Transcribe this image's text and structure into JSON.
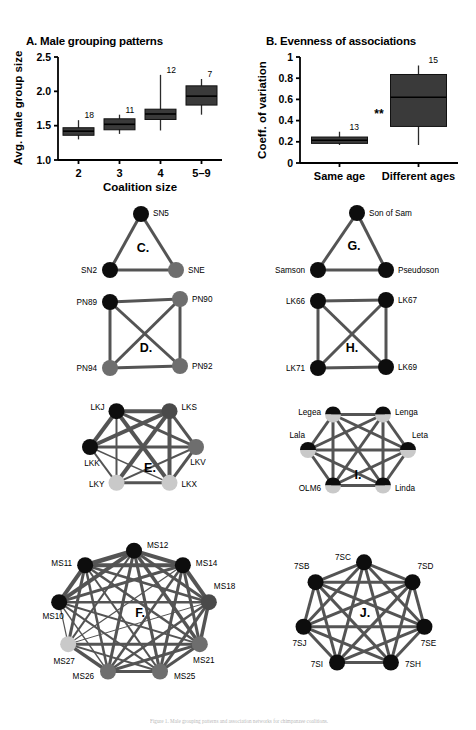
{
  "figure": {
    "caption_fragment": "Figure 1. Male grouping patterns and association networks for chimpanzee coalitions."
  },
  "panels": {
    "A": {
      "letter": "A.",
      "title": "Male grouping patterns",
      "ylabel": "Avg. male group size",
      "xlabel": "Coalition size"
    },
    "B": {
      "letter": "B.",
      "title": "Evenness of associations",
      "ylabel": "Coeff. of variation",
      "xlabel": "",
      "significance": "**"
    },
    "C": {
      "letter": "C."
    },
    "D": {
      "letter": "D."
    },
    "E": {
      "letter": "E."
    },
    "F": {
      "letter": "F."
    },
    "G": {
      "letter": "G."
    },
    "H": {
      "letter": "H."
    },
    "I": {
      "letter": "I."
    },
    "J": {
      "letter": "J."
    }
  },
  "chart_data": [
    {
      "id": "A",
      "type": "box",
      "title": "Male grouping patterns",
      "xlabel": "Coalition size",
      "ylabel": "Avg. male group size",
      "ylim": [
        1.0,
        2.5
      ],
      "yticks": [
        1.0,
        1.5,
        2.0,
        2.5
      ],
      "ytick_labels": [
        "1.0",
        "1.5",
        "2.0",
        "2.5"
      ],
      "categories": [
        "2",
        "3",
        "4",
        "5–9"
      ],
      "counts": [
        18,
        11,
        12,
        7
      ],
      "boxes": [
        {
          "category": "2",
          "n": 18,
          "whisker_low": 1.3,
          "q1": 1.36,
          "median": 1.42,
          "q3": 1.47,
          "whisker_high": 1.58
        },
        {
          "category": "3",
          "n": 11,
          "whisker_low": 1.38,
          "q1": 1.44,
          "median": 1.52,
          "q3": 1.6,
          "whisker_high": 1.66
        },
        {
          "category": "4",
          "n": 12,
          "whisker_low": 1.43,
          "q1": 1.59,
          "median": 1.67,
          "q3": 1.74,
          "whisker_high": 2.24
        },
        {
          "category": "5–9",
          "n": 7,
          "whisker_low": 1.66,
          "q1": 1.8,
          "median": 1.93,
          "q3": 2.08,
          "whisker_high": 2.18
        }
      ],
      "grid": false,
      "legend": "none"
    },
    {
      "id": "B",
      "type": "box",
      "title": "Evenness of associations",
      "xlabel": "",
      "ylabel": "Coeff. of variation",
      "ylim": [
        0,
        1
      ],
      "yticks": [
        0,
        0.2,
        0.4,
        0.6,
        0.8,
        1
      ],
      "ytick_labels": [
        "0",
        "0.2",
        "0.4",
        "0.6",
        "0.8",
        "1"
      ],
      "categories": [
        "Same age",
        "Different ages"
      ],
      "counts": [
        13,
        15
      ],
      "annotations": [
        {
          "text": "**",
          "between": [
            "Same age",
            "Different ages"
          ],
          "y": 0.42
        }
      ],
      "boxes": [
        {
          "category": "Same age",
          "n": 13,
          "whisker_low": 0.17,
          "q1": 0.185,
          "median": 0.215,
          "q3": 0.245,
          "whisker_high": 0.295
        },
        {
          "category": "Different ages",
          "n": 15,
          "whisker_low": 0.17,
          "q1": 0.345,
          "median": 0.62,
          "q3": 0.835,
          "whisker_high": 0.92
        }
      ],
      "grid": false,
      "legend": "none"
    },
    {
      "id": "C",
      "type": "network",
      "title": "C.",
      "nodes": [
        {
          "id": "SN5",
          "label": "SN5",
          "shade": "black"
        },
        {
          "id": "SN2",
          "label": "SN2",
          "shade": "black"
        },
        {
          "id": "SNE",
          "label": "SNE",
          "shade": "gray"
        }
      ],
      "edges": [
        {
          "from": "SN5",
          "to": "SN2",
          "weight": 3
        },
        {
          "from": "SN5",
          "to": "SNE",
          "weight": 3
        },
        {
          "from": "SN2",
          "to": "SNE",
          "weight": 3
        }
      ]
    },
    {
      "id": "D",
      "type": "network",
      "title": "D.",
      "nodes": [
        {
          "id": "PN89",
          "label": "PN89",
          "shade": "black"
        },
        {
          "id": "PN90",
          "label": "PN90",
          "shade": "gray"
        },
        {
          "id": "PN94",
          "label": "PN94",
          "shade": "gray"
        },
        {
          "id": "PN92",
          "label": "PN92",
          "shade": "gray"
        }
      ],
      "edges": [
        {
          "from": "PN89",
          "to": "PN90",
          "weight": 3
        },
        {
          "from": "PN89",
          "to": "PN94",
          "weight": 3
        },
        {
          "from": "PN89",
          "to": "PN92",
          "weight": 3
        },
        {
          "from": "PN90",
          "to": "PN94",
          "weight": 3
        },
        {
          "from": "PN90",
          "to": "PN92",
          "weight": 3
        },
        {
          "from": "PN94",
          "to": "PN92",
          "weight": 3
        }
      ]
    },
    {
      "id": "E",
      "type": "network",
      "title": "E.",
      "nodes": [
        {
          "id": "LKJ",
          "label": "LKJ",
          "shade": "black"
        },
        {
          "id": "LKS",
          "label": "LKS",
          "shade": "darkgray"
        },
        {
          "id": "LKV",
          "label": "LKV",
          "shade": "gray"
        },
        {
          "id": "LKX",
          "label": "LKX",
          "shade": "lightgray"
        },
        {
          "id": "LKY",
          "label": "LKY",
          "shade": "lightgray"
        },
        {
          "id": "LKK",
          "label": "LKK",
          "shade": "black"
        }
      ],
      "edges": [
        {
          "from": "LKJ",
          "to": "LKS",
          "weight": 4
        },
        {
          "from": "LKJ",
          "to": "LKV",
          "weight": 3
        },
        {
          "from": "LKJ",
          "to": "LKX",
          "weight": 4
        },
        {
          "from": "LKJ",
          "to": "LKY",
          "weight": 2
        },
        {
          "from": "LKJ",
          "to": "LKK",
          "weight": 4
        },
        {
          "from": "LKS",
          "to": "LKV",
          "weight": 3
        },
        {
          "from": "LKS",
          "to": "LKX",
          "weight": 4
        },
        {
          "from": "LKS",
          "to": "LKY",
          "weight": 4
        },
        {
          "from": "LKS",
          "to": "LKK",
          "weight": 4
        },
        {
          "from": "LKV",
          "to": "LKX",
          "weight": 3
        },
        {
          "from": "LKV",
          "to": "LKY",
          "weight": 2
        },
        {
          "from": "LKV",
          "to": "LKK",
          "weight": 3
        },
        {
          "from": "LKX",
          "to": "LKY",
          "weight": 3
        },
        {
          "from": "LKX",
          "to": "LKK",
          "weight": 1.4
        },
        {
          "from": "LKY",
          "to": "LKK",
          "weight": 2
        }
      ]
    },
    {
      "id": "F",
      "type": "network",
      "title": "F.",
      "nodes": [
        {
          "id": "MS12",
          "label": "MS12",
          "shade": "black"
        },
        {
          "id": "MS14",
          "label": "MS14",
          "shade": "black"
        },
        {
          "id": "MS18",
          "label": "MS18",
          "shade": "darkgray"
        },
        {
          "id": "MS21",
          "label": "MS21",
          "shade": "gray"
        },
        {
          "id": "MS25",
          "label": "MS25",
          "shade": "gray"
        },
        {
          "id": "MS26",
          "label": "MS26",
          "shade": "gray"
        },
        {
          "id": "MS27",
          "label": "MS27",
          "shade": "lightgray"
        },
        {
          "id": "MS10",
          "label": "MS10",
          "shade": "black"
        },
        {
          "id": "MS11",
          "label": "MS11",
          "shade": "black"
        }
      ],
      "edges": [
        {
          "from": "MS12",
          "to": "MS14",
          "weight": 4
        },
        {
          "from": "MS12",
          "to": "MS18",
          "weight": 3
        },
        {
          "from": "MS12",
          "to": "MS21",
          "weight": 3.5
        },
        {
          "from": "MS12",
          "to": "MS25",
          "weight": 3
        },
        {
          "from": "MS12",
          "to": "MS26",
          "weight": 3
        },
        {
          "from": "MS12",
          "to": "MS27",
          "weight": 2
        },
        {
          "from": "MS12",
          "to": "MS10",
          "weight": 4
        },
        {
          "from": "MS12",
          "to": "MS11",
          "weight": 4.5
        },
        {
          "from": "MS14",
          "to": "MS18",
          "weight": 4
        },
        {
          "from": "MS14",
          "to": "MS21",
          "weight": 3
        },
        {
          "from": "MS14",
          "to": "MS25",
          "weight": 3
        },
        {
          "from": "MS14",
          "to": "MS26",
          "weight": 2.5
        },
        {
          "from": "MS14",
          "to": "MS27",
          "weight": 1.2
        },
        {
          "from": "MS14",
          "to": "MS10",
          "weight": 3
        },
        {
          "from": "MS14",
          "to": "MS11",
          "weight": 4
        },
        {
          "from": "MS18",
          "to": "MS21",
          "weight": 3.5
        },
        {
          "from": "MS18",
          "to": "MS25",
          "weight": 3
        },
        {
          "from": "MS18",
          "to": "MS26",
          "weight": 2.5
        },
        {
          "from": "MS18",
          "to": "MS27",
          "weight": 1
        },
        {
          "from": "MS18",
          "to": "MS10",
          "weight": 2.5
        },
        {
          "from": "MS18",
          "to": "MS11",
          "weight": 2.5
        },
        {
          "from": "MS21",
          "to": "MS25",
          "weight": 3
        },
        {
          "from": "MS21",
          "to": "MS26",
          "weight": 3
        },
        {
          "from": "MS21",
          "to": "MS27",
          "weight": 3
        },
        {
          "from": "MS21",
          "to": "MS10",
          "weight": 2
        },
        {
          "from": "MS21",
          "to": "MS11",
          "weight": 2.5
        },
        {
          "from": "MS25",
          "to": "MS26",
          "weight": 3
        },
        {
          "from": "MS25",
          "to": "MS27",
          "weight": 2
        },
        {
          "from": "MS25",
          "to": "MS10",
          "weight": 2
        },
        {
          "from": "MS25",
          "to": "MS11",
          "weight": 2
        },
        {
          "from": "MS26",
          "to": "MS27",
          "weight": 3.5
        },
        {
          "from": "MS26",
          "to": "MS10",
          "weight": 1.5
        },
        {
          "from": "MS26",
          "to": "MS11",
          "weight": 2.5
        },
        {
          "from": "MS27",
          "to": "MS10",
          "weight": 1.2
        },
        {
          "from": "MS27",
          "to": "MS11",
          "weight": 3
        },
        {
          "from": "MS10",
          "to": "MS11",
          "weight": 4
        }
      ]
    },
    {
      "id": "G",
      "type": "network",
      "title": "G.",
      "nodes": [
        {
          "id": "SonOfSam",
          "label": "Son of Sam",
          "shade": "black"
        },
        {
          "id": "Samson",
          "label": "Samson",
          "shade": "black"
        },
        {
          "id": "Pseudoson",
          "label": "Pseudoson",
          "shade": "black"
        }
      ],
      "edges": [
        {
          "from": "SonOfSam",
          "to": "Samson",
          "weight": 3
        },
        {
          "from": "SonOfSam",
          "to": "Pseudoson",
          "weight": 3
        },
        {
          "from": "Samson",
          "to": "Pseudoson",
          "weight": 3
        }
      ]
    },
    {
      "id": "H",
      "type": "network",
      "title": "H.",
      "nodes": [
        {
          "id": "LK66",
          "label": "LK66",
          "shade": "black"
        },
        {
          "id": "LK67",
          "label": "LK67",
          "shade": "black"
        },
        {
          "id": "LK71",
          "label": "LK71",
          "shade": "black"
        },
        {
          "id": "LK69",
          "label": "LK69",
          "shade": "black"
        }
      ],
      "edges": [
        {
          "from": "LK66",
          "to": "LK67",
          "weight": 3
        },
        {
          "from": "LK66",
          "to": "LK71",
          "weight": 3
        },
        {
          "from": "LK66",
          "to": "LK69",
          "weight": 3
        },
        {
          "from": "LK67",
          "to": "LK71",
          "weight": 3
        },
        {
          "from": "LK67",
          "to": "LK69",
          "weight": 3
        },
        {
          "from": "LK71",
          "to": "LK69",
          "weight": 3
        }
      ]
    },
    {
      "id": "I",
      "type": "network",
      "title": "I.",
      "nodes": [
        {
          "id": "Legea",
          "label": "Legea",
          "shade": "half"
        },
        {
          "id": "Lenga",
          "label": "Lenga",
          "shade": "half"
        },
        {
          "id": "Leta",
          "label": "Leta",
          "shade": "half"
        },
        {
          "id": "Linda",
          "label": "Linda",
          "shade": "half"
        },
        {
          "id": "OLM6",
          "label": "OLM6",
          "shade": "half"
        },
        {
          "id": "Lala",
          "label": "Lala",
          "shade": "half"
        }
      ],
      "edges": [
        {
          "from": "Legea",
          "to": "Lenga",
          "weight": 3
        },
        {
          "from": "Legea",
          "to": "Leta",
          "weight": 3
        },
        {
          "from": "Legea",
          "to": "Linda",
          "weight": 3
        },
        {
          "from": "Legea",
          "to": "OLM6",
          "weight": 3
        },
        {
          "from": "Legea",
          "to": "Lala",
          "weight": 3
        },
        {
          "from": "Lenga",
          "to": "Leta",
          "weight": 3
        },
        {
          "from": "Lenga",
          "to": "Linda",
          "weight": 3
        },
        {
          "from": "Lenga",
          "to": "OLM6",
          "weight": 3
        },
        {
          "from": "Lenga",
          "to": "Lala",
          "weight": 3
        },
        {
          "from": "Leta",
          "to": "Linda",
          "weight": 3
        },
        {
          "from": "Leta",
          "to": "OLM6",
          "weight": 3
        },
        {
          "from": "Leta",
          "to": "Lala",
          "weight": 3
        },
        {
          "from": "Linda",
          "to": "OLM6",
          "weight": 3
        },
        {
          "from": "Linda",
          "to": "Lala",
          "weight": 3
        },
        {
          "from": "OLM6",
          "to": "Lala",
          "weight": 3
        }
      ]
    },
    {
      "id": "J",
      "type": "network",
      "title": "J.",
      "nodes": [
        {
          "id": "7SC",
          "label": "7SC",
          "shade": "black"
        },
        {
          "id": "7SD",
          "label": "7SD",
          "shade": "black"
        },
        {
          "id": "7SE",
          "label": "7SE",
          "shade": "black"
        },
        {
          "id": "7SH",
          "label": "7SH",
          "shade": "black"
        },
        {
          "id": "7SI",
          "label": "7SI",
          "shade": "black"
        },
        {
          "id": "7SJ",
          "label": "7SJ",
          "shade": "black"
        },
        {
          "id": "7SB",
          "label": "7SB",
          "shade": "black"
        }
      ],
      "edges": [
        {
          "from": "7SC",
          "to": "7SD",
          "weight": 3
        },
        {
          "from": "7SC",
          "to": "7SE",
          "weight": 3
        },
        {
          "from": "7SC",
          "to": "7SH",
          "weight": 3
        },
        {
          "from": "7SC",
          "to": "7SI",
          "weight": 3
        },
        {
          "from": "7SC",
          "to": "7SJ",
          "weight": 3
        },
        {
          "from": "7SC",
          "to": "7SB",
          "weight": 3
        },
        {
          "from": "7SD",
          "to": "7SE",
          "weight": 3
        },
        {
          "from": "7SD",
          "to": "7SH",
          "weight": 3
        },
        {
          "from": "7SD",
          "to": "7SI",
          "weight": 3
        },
        {
          "from": "7SD",
          "to": "7SJ",
          "weight": 3
        },
        {
          "from": "7SD",
          "to": "7SB",
          "weight": 3
        },
        {
          "from": "7SE",
          "to": "7SH",
          "weight": 3
        },
        {
          "from": "7SE",
          "to": "7SI",
          "weight": 3
        },
        {
          "from": "7SE",
          "to": "7SJ",
          "weight": 3
        },
        {
          "from": "7SE",
          "to": "7SB",
          "weight": 3
        },
        {
          "from": "7SH",
          "to": "7SI",
          "weight": 3
        },
        {
          "from": "7SH",
          "to": "7SJ",
          "weight": 3
        },
        {
          "from": "7SH",
          "to": "7SB",
          "weight": 3
        },
        {
          "from": "7SI",
          "to": "7SJ",
          "weight": 3
        },
        {
          "from": "7SI",
          "to": "7SB",
          "weight": 3
        },
        {
          "from": "7SJ",
          "to": "7SB",
          "weight": 3
        }
      ]
    }
  ],
  "colors": {
    "node_black": "#0d0d0d",
    "node_darkgray": "#4a4a4a",
    "node_gray": "#6e6e6e",
    "node_lightgray": "#c9c9c9",
    "edge": "#545454",
    "box_fill": "#3a3a3a",
    "axis": "#000000"
  }
}
